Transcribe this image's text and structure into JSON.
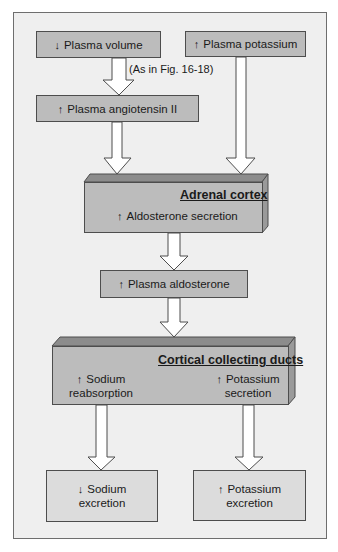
{
  "diagram": {
    "boxes": {
      "plasma_volume": {
        "arrow": "↓",
        "label": "Plasma volume"
      },
      "plasma_potassium": {
        "arrow": "↑",
        "label": "Plasma potassium"
      },
      "plasma_angiotensin": {
        "arrow": "↑",
        "label": "Plasma angiotensin II"
      },
      "adrenal_cortex": {
        "title": "Adrenal cortex",
        "arrow": "↑",
        "label": "Aldosterone secretion"
      },
      "plasma_aldosterone": {
        "arrow": "↑",
        "label": "Plasma aldosterone"
      },
      "cortical_collecting_ducts": {
        "title": "Cortical collecting ducts",
        "left": {
          "arrow": "↑",
          "line1": "Sodium",
          "line2": "reabsorption"
        },
        "right": {
          "arrow": "↑",
          "line1": "Potassium",
          "line2": "secretion"
        }
      },
      "sodium_excretion": {
        "arrow": "↓",
        "line1": "Sodium",
        "line2": "excretion"
      },
      "potassium_excretion": {
        "arrow": "↑",
        "line1": "Potassium",
        "line2": "excretion"
      }
    },
    "annotation": "(As in Fig. 16-18)",
    "colors": {
      "frame_bg": "#efefef",
      "box_fill": "#bcbcbc",
      "light_box_fill": "#dcdcdc",
      "box_top_face": "#8c8c8c",
      "box_side_face": "#9a9a9a",
      "border": "#4d4d4d"
    }
  }
}
